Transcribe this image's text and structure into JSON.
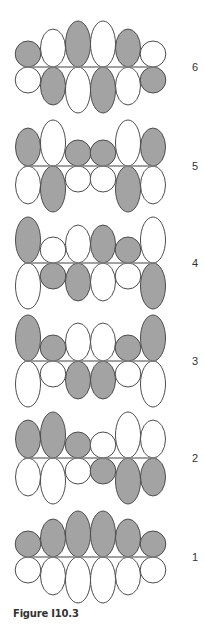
{
  "figure": {
    "caption": "Figure I10.3",
    "colors": {
      "shaded_fill": "#a3a3a3",
      "white_fill": "#ffffff",
      "stroke": "#4d4d4d",
      "axis_line": "#808080",
      "label": "#333333"
    },
    "lobe_sizes": {
      "s": 13,
      "m": 19,
      "l": 23
    },
    "columns_x": [
      28,
      53,
      78,
      103,
      128,
      153
    ],
    "label_x": 195,
    "diagrams": [
      {
        "label": "6",
        "baseline_y": 67,
        "top": [
          [
            "S",
            "s"
          ],
          [
            "W",
            "m"
          ],
          [
            "S",
            "l"
          ],
          [
            "W",
            "l"
          ],
          [
            "S",
            "m"
          ],
          [
            "W",
            "s"
          ]
        ],
        "bottom": [
          [
            "W",
            "s"
          ],
          [
            "S",
            "m"
          ],
          [
            "W",
            "l"
          ],
          [
            "S",
            "l"
          ],
          [
            "W",
            "m"
          ],
          [
            "S",
            "s"
          ]
        ]
      },
      {
        "label": "5",
        "baseline_y": 166,
        "top": [
          [
            "S",
            "m"
          ],
          [
            "W",
            "l"
          ],
          [
            "S",
            "s"
          ],
          [
            "S",
            "s"
          ],
          [
            "W",
            "l"
          ],
          [
            "S",
            "m"
          ]
        ],
        "bottom": [
          [
            "W",
            "m"
          ],
          [
            "S",
            "l"
          ],
          [
            "W",
            "s"
          ],
          [
            "W",
            "s"
          ],
          [
            "S",
            "l"
          ],
          [
            "W",
            "m"
          ]
        ]
      },
      {
        "label": "4",
        "baseline_y": 263,
        "top": [
          [
            "S",
            "l"
          ],
          [
            "W",
            "s"
          ],
          [
            "W",
            "m"
          ],
          [
            "S",
            "m"
          ],
          [
            "S",
            "s"
          ],
          [
            "W",
            "l"
          ]
        ],
        "bottom": [
          [
            "W",
            "l"
          ],
          [
            "S",
            "s"
          ],
          [
            "S",
            "m"
          ],
          [
            "W",
            "m"
          ],
          [
            "W",
            "s"
          ],
          [
            "S",
            "l"
          ]
        ]
      },
      {
        "label": "3",
        "baseline_y": 361,
        "top": [
          [
            "S",
            "l"
          ],
          [
            "S",
            "s"
          ],
          [
            "W",
            "m"
          ],
          [
            "W",
            "m"
          ],
          [
            "S",
            "s"
          ],
          [
            "S",
            "l"
          ]
        ],
        "bottom": [
          [
            "W",
            "l"
          ],
          [
            "W",
            "s"
          ],
          [
            "S",
            "m"
          ],
          [
            "S",
            "m"
          ],
          [
            "W",
            "s"
          ],
          [
            "W",
            "l"
          ]
        ]
      },
      {
        "label": "2",
        "baseline_y": 458,
        "top": [
          [
            "S",
            "m"
          ],
          [
            "S",
            "l"
          ],
          [
            "S",
            "s"
          ],
          [
            "W",
            "s"
          ],
          [
            "W",
            "l"
          ],
          [
            "W",
            "m"
          ]
        ],
        "bottom": [
          [
            "W",
            "m"
          ],
          [
            "W",
            "l"
          ],
          [
            "W",
            "s"
          ],
          [
            "S",
            "s"
          ],
          [
            "S",
            "l"
          ],
          [
            "S",
            "m"
          ]
        ]
      },
      {
        "label": "1",
        "baseline_y": 557,
        "top": [
          [
            "S",
            "s"
          ],
          [
            "S",
            "m"
          ],
          [
            "S",
            "l"
          ],
          [
            "S",
            "l"
          ],
          [
            "S",
            "m"
          ],
          [
            "S",
            "s"
          ]
        ],
        "bottom": [
          [
            "W",
            "s"
          ],
          [
            "W",
            "m"
          ],
          [
            "W",
            "l"
          ],
          [
            "W",
            "l"
          ],
          [
            "W",
            "m"
          ],
          [
            "W",
            "s"
          ]
        ]
      }
    ]
  }
}
